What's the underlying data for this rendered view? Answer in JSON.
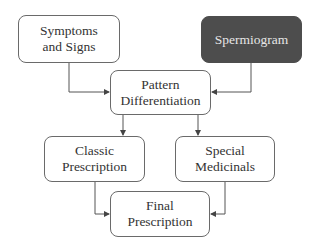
{
  "diagram": {
    "type": "flowchart",
    "nodes": [
      {
        "id": "symptoms",
        "label": "Symptoms\nand Signs",
        "style": "light"
      },
      {
        "id": "spermiogram",
        "label": "Spermiogram",
        "style": "dark"
      },
      {
        "id": "pattern",
        "label": "Pattern\nDifferentiation",
        "style": "light"
      },
      {
        "id": "classic",
        "label": "Classic\nPrescription",
        "style": "light"
      },
      {
        "id": "special",
        "label": "Special\nMedicinals",
        "style": "light"
      },
      {
        "id": "final",
        "label": "Final\nPrescription",
        "style": "light"
      }
    ],
    "edges": [
      {
        "from": "symptoms",
        "to": "pattern"
      },
      {
        "from": "spermiogram",
        "to": "pattern"
      },
      {
        "from": "pattern",
        "to": "classic"
      },
      {
        "from": "pattern",
        "to": "special"
      },
      {
        "from": "classic",
        "to": "final"
      },
      {
        "from": "special",
        "to": "final"
      }
    ],
    "colors": {
      "dark_fill": "#4d4d4d",
      "border": "#6a6a6a",
      "line": "#555555"
    }
  }
}
